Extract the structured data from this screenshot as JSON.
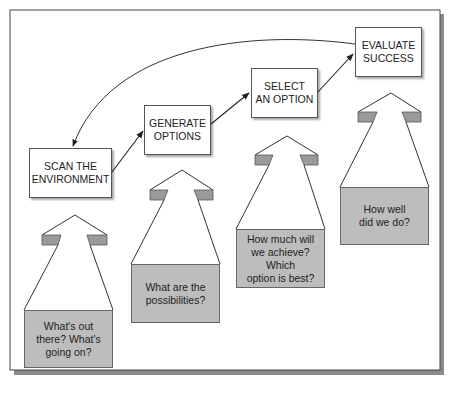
{
  "diagram": {
    "type": "process-cycle",
    "colors": {
      "frame_border": "#444444",
      "frame_shadow": "#7a7a7a",
      "question_box_fill": "#bdbdbd",
      "wing_fill": "#9a9a9a",
      "line": "#222222"
    },
    "steps": [
      {
        "label": "SCAN THE\nENVIRONMENT",
        "line1": "SCAN THE",
        "line2": "ENVIRONMENT",
        "question": [
          "What's out",
          "there? What's",
          "going on?"
        ]
      },
      {
        "label": "GENERATE\nOPTIONS",
        "line1": "GENERATE",
        "line2": "OPTIONS",
        "question": [
          "What are the",
          "possibilities?"
        ]
      },
      {
        "label": "SELECT\nAN OPTION",
        "line1": "SELECT",
        "line2": "AN OPTION",
        "question": [
          "How much will",
          "we achieve?",
          "Which",
          "option is best?"
        ]
      },
      {
        "label": "EVALUATE\nSUCCESS",
        "line1": "EVALUATE",
        "line2": "SUCCESS",
        "question": [
          "How well",
          "did we do?"
        ]
      }
    ],
    "connections": [
      {
        "from": "SCAN THE ENVIRONMENT",
        "to": "GENERATE OPTIONS"
      },
      {
        "from": "GENERATE OPTIONS",
        "to": "SELECT AN OPTION"
      },
      {
        "from": "SELECT AN OPTION",
        "to": "EVALUATE SUCCESS"
      },
      {
        "from": "EVALUATE SUCCESS",
        "to": "SCAN THE ENVIRONMENT",
        "style": "curved-feedback"
      }
    ]
  }
}
